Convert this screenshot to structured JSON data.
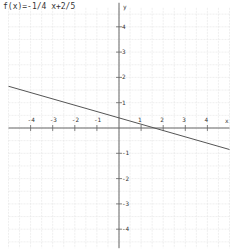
{
  "chart_data": {
    "type": "line",
    "title": "f(x)=-1/4 x+2/5",
    "function": {
      "slope": -0.25,
      "intercept": 0.4
    },
    "series": [
      {
        "name": "f(x)",
        "x": [
          -5,
          5
        ],
        "y": [
          1.65,
          -0.85
        ]
      }
    ],
    "xlabel": "x",
    "ylabel": "y",
    "xlim": [
      -5,
      5
    ],
    "ylim": [
      -5,
      5
    ],
    "x_ticks": [
      "-4",
      "-3",
      "-2",
      "-1",
      "1",
      "2",
      "3",
      "4"
    ],
    "y_ticks": [
      "4",
      "3",
      "2",
      "1",
      "-1",
      "-2",
      "-3",
      "-4"
    ],
    "grid": true,
    "colors": {
      "line": "#555555",
      "axis": "#666666",
      "grid": "#e4e4e4"
    }
  }
}
